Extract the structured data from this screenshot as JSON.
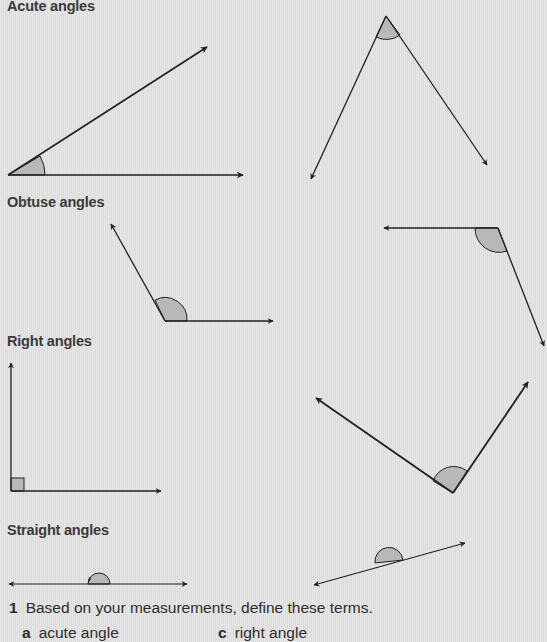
{
  "sections": {
    "acute": {
      "heading": "Acute angles"
    },
    "obtuse": {
      "heading": "Obtuse angles"
    },
    "right": {
      "heading": "Right angles"
    },
    "straight": {
      "heading": "Straight angles"
    }
  },
  "question": {
    "number": "1",
    "text": "Based on your measurements, define these terms.",
    "parts": [
      {
        "letter": "a",
        "text": "acute angle"
      },
      {
        "letter": "c",
        "text": "right angle"
      }
    ]
  },
  "colors": {
    "background": "#e2e2e2",
    "line": "#231f20",
    "angle_fill": "#b8b8b8"
  }
}
